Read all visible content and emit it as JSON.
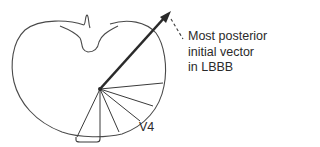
{
  "diagram": {
    "type": "anatomical cross-section with vector",
    "annotation": {
      "lines": [
        "Most posterior",
        "initial vector",
        "in LBBB"
      ]
    },
    "lead_label": "V4",
    "colors": {
      "ink": "#2a2a2a",
      "outline": "#4a4a4a",
      "background": "#ffffff"
    }
  }
}
